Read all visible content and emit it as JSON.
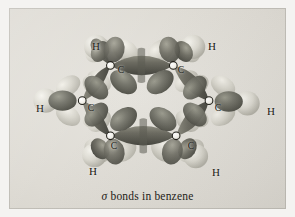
{
  "figure": {
    "type": "molecular-orbital-illustration",
    "molecule": "benzene",
    "background_color": "#dedbd4",
    "frame_color": "#f4f3f1"
  },
  "caption": {
    "symbol": "σ",
    "text": " bonds in benzene",
    "full": "σ bonds in benzene"
  },
  "palette": {
    "lobe_dark": "#6e6d62",
    "lobe_dark_shadow": "#4a4a42",
    "lobe_dark_highlight": "#8d8c80",
    "lobe_light": "#cfcdc4",
    "lobe_light_highlight": "#eceae3",
    "hydrogen_sphere": "#d6d4cb",
    "nucleus": "#faf9f5",
    "nucleus_outline": "#1d1c16",
    "label_text": "#16150f"
  },
  "atoms": {
    "carbons": [
      {
        "id": "C1",
        "label": "C",
        "x": 108,
        "y": 62
      },
      {
        "id": "C2",
        "label": "C",
        "x": 175,
        "y": 62
      },
      {
        "id": "C3",
        "label": "C",
        "x": 213,
        "y": 100
      },
      {
        "id": "C4",
        "label": "C",
        "x": 178,
        "y": 138
      },
      {
        "id": "C5",
        "label": "C",
        "x": 108,
        "y": 138
      },
      {
        "id": "C6",
        "label": "C",
        "x": 78,
        "y": 100
      }
    ],
    "hydrogens": [
      {
        "id": "H1",
        "label": "H",
        "x": 87,
        "y": 38
      },
      {
        "id": "H2",
        "label": "H",
        "x": 203,
        "y": 38
      },
      {
        "id": "H3",
        "label": "H",
        "x": 262,
        "y": 103
      },
      {
        "id": "H4",
        "label": "H",
        "x": 207,
        "y": 164
      },
      {
        "id": "H5",
        "label": "H",
        "x": 84,
        "y": 163
      },
      {
        "id": "H6",
        "label": "H",
        "x": 31,
        "y": 100
      }
    ]
  },
  "bonds": {
    "carbon_carbon_count": 6,
    "carbon_hydrogen_count": 6,
    "carbon_carbon_shape": "lens",
    "carbon_hydrogen_shape": "teardrop",
    "note": "sp2-sp2 sigma overlap between carbons; sp2-1s sigma overlap to hydrogens"
  }
}
